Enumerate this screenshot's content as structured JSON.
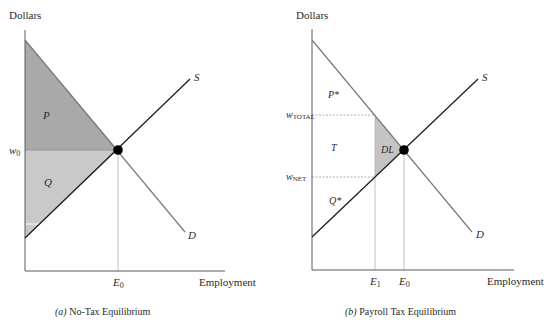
{
  "panels": [
    {
      "id": "a",
      "y_axis_label": "Dollars",
      "x_axis_label": "Employment",
      "caption_prefix": "(a)",
      "caption_text": " No-Tax Equilibrium",
      "supply_label": "S",
      "demand_label": "D",
      "wage_label_main": "w",
      "wage_label_sub": "0",
      "emp_label_main": "E",
      "emp_label_sub": "0",
      "region_labels": {
        "producer": "P",
        "worker": "Q"
      }
    },
    {
      "id": "b",
      "y_axis_label": "Dollars",
      "x_axis_label": "Employment",
      "caption_prefix": "(b)",
      "caption_text": " Payroll Tax Equilibrium",
      "supply_label": "S",
      "demand_label": "D",
      "wage_total_main": "w",
      "wage_total_sub": "TOTAL",
      "wage_net_main": "w",
      "wage_net_sub": "NET",
      "emp1_main": "E",
      "emp1_sub": "1",
      "emp0_main": "E",
      "emp0_sub": "0",
      "region_labels": {
        "producer": "P*",
        "tax": "T",
        "deadweight": "DL",
        "worker": "Q*"
      }
    }
  ],
  "colors": {
    "demand_line": "#7a7a7a",
    "supply_line": "#1e1e1e",
    "axis": "#5a5a5a",
    "dashed": "#9a9a9a",
    "region_dark": "#a8a8a8",
    "region_light": "#c8c8c8",
    "deadweight": "#c4c4c4",
    "equilibrium_dot": "#000000"
  }
}
